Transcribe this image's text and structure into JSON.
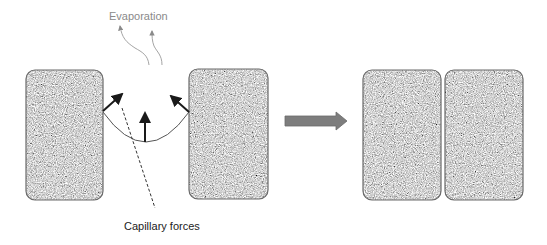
{
  "labels": {
    "evaporation": "Evaporation",
    "capillary_forces": "Capillary forces"
  },
  "colors": {
    "particle_fill": "#9a9a9a",
    "particle_border": "#6a6a6a",
    "arrow_fill": "#7d7d7d",
    "force_arrow": "#1a1a1a",
    "vapor_line": "#9a9a9a"
  },
  "stages": [
    {
      "name": "before",
      "particles": 2,
      "description": "Two particles separated by liquid meniscus"
    },
    {
      "name": "after",
      "particles": 2,
      "description": "Particles pulled into contact"
    }
  ]
}
